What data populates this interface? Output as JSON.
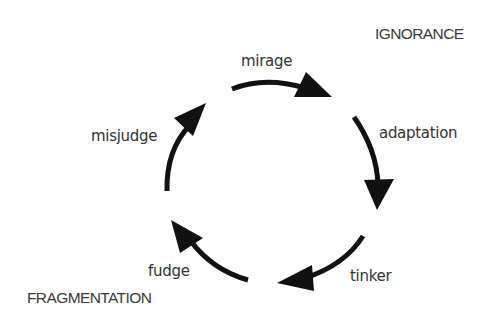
{
  "diagram": {
    "type": "cycle",
    "direction": "clockwise",
    "colors": {
      "arrow": "#111111",
      "text": "#333333",
      "background": "#ffffff"
    },
    "corner_labels": {
      "top_right": "IGNORANCE",
      "bottom_left": "FRAGMENTATION"
    },
    "steps": [
      {
        "id": "mirage",
        "label": "mirage"
      },
      {
        "id": "adaptation",
        "label": "adaptation"
      },
      {
        "id": "tinker",
        "label": "tinker"
      },
      {
        "id": "fudge",
        "label": "fudge"
      },
      {
        "id": "misjudge",
        "label": "misjudge"
      }
    ]
  }
}
